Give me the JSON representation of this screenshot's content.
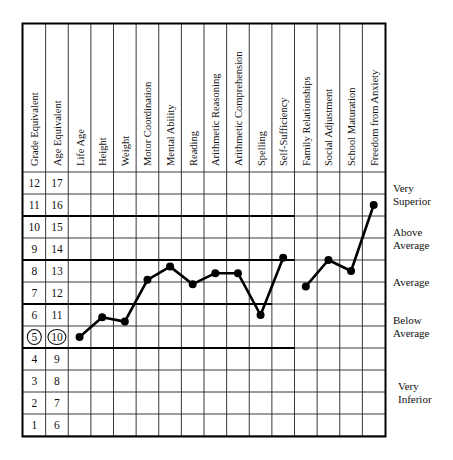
{
  "chart_data": {
    "type": "line",
    "title": "",
    "xlabel": "",
    "ylabel": "Grade Equivalent / Age Equivalent",
    "grid": true,
    "legend": "none",
    "categories": [
      "Grade Equivalent",
      "Age Equivalent",
      "Life Age",
      "Height",
      "Weight",
      "Motor Coordination",
      "Mental Ability",
      "Reading",
      "Arithmetic Reasoning",
      "Arithmetic Comprehension",
      "Spelling",
      "Self-Sufficiency",
      "Family Relationships",
      "Social Adjustment",
      "School Maturation",
      "Freedom from Anxiety"
    ],
    "plotted_categories": [
      "Life Age",
      "Height",
      "Weight",
      "Motor Coordination",
      "Mental Ability",
      "Reading",
      "Arithmetic Reasoning",
      "Arithmetic Comprehension",
      "Spelling",
      "Self-Sufficiency",
      "Family Relationships",
      "Social Adjustment",
      "School Maturation",
      "Freedom from Anxiety"
    ],
    "grade_values": [
      5.0,
      5.9,
      5.7,
      7.6,
      8.2,
      7.4,
      7.9,
      7.9,
      6.0,
      8.6,
      7.3,
      8.5,
      8.0,
      11.0
    ],
    "age_values": [
      10,
      10.9,
      10.7,
      12.6,
      13.2,
      12.4,
      12.9,
      12.9,
      11.0,
      13.6,
      12.3,
      13.5,
      13.0,
      16.0
    ],
    "series": [
      {
        "name": "Profile",
        "points": [
          {
            "category": "Life Age",
            "grade": 5.0,
            "age": 10
          },
          {
            "category": "Height",
            "grade": 5.9,
            "age": 10.9
          },
          {
            "category": "Weight",
            "grade": 5.7,
            "age": 10.7
          },
          {
            "category": "Motor Coordination",
            "grade": 7.6,
            "age": 12.6
          },
          {
            "category": "Mental Ability",
            "grade": 8.2,
            "age": 13.2
          },
          {
            "category": "Reading",
            "grade": 7.4,
            "age": 12.4
          },
          {
            "category": "Arithmetic Reasoning",
            "grade": 7.9,
            "age": 12.9
          },
          {
            "category": "Arithmetic Comprehension",
            "grade": 7.9,
            "age": 12.9
          },
          {
            "category": "Spelling",
            "grade": 6.0,
            "age": 11.0
          },
          {
            "category": "Self-Sufficiency",
            "grade": 8.6,
            "age": 13.6
          },
          {
            "category": "Family Relationships",
            "grade": 7.3,
            "age": 12.3
          },
          {
            "category": "Social Adjustment",
            "grade": 8.5,
            "age": 13.5
          },
          {
            "category": "School Maturation",
            "grade": 8.0,
            "age": 13.0
          },
          {
            "category": "Freedom from Anxiety",
            "grade": 11.0,
            "age": 16.0
          }
        ],
        "line_breaks_after": [
          "Self-Sufficiency"
        ]
      }
    ],
    "y_rows": [
      {
        "grade": "12",
        "age": "17",
        "circled": false
      },
      {
        "grade": "11",
        "age": "16",
        "circled": false
      },
      {
        "grade": "10",
        "age": "15",
        "circled": false
      },
      {
        "grade": "9",
        "age": "14",
        "circled": false
      },
      {
        "grade": "8",
        "age": "13",
        "circled": false
      },
      {
        "grade": "7",
        "age": "12",
        "circled": false
      },
      {
        "grade": "6",
        "age": "11",
        "circled": false
      },
      {
        "grade": "5",
        "age": "10",
        "circled": true
      },
      {
        "grade": "4",
        "age": "9",
        "circled": false
      },
      {
        "grade": "3",
        "age": "8",
        "circled": false
      },
      {
        "grade": "2",
        "age": "7",
        "circled": false
      },
      {
        "grade": "1",
        "age": "6",
        "circled": false
      }
    ],
    "bands": [
      {
        "label_line1": "Very",
        "label_line2": "Superior",
        "top_row": 0,
        "bottom_row": 1
      },
      {
        "label_line1": "Above",
        "label_line2": "Average",
        "top_row": 2,
        "bottom_row": 3
      },
      {
        "label_line1": "Average",
        "label_line2": "",
        "top_row": 4,
        "bottom_row": 5
      },
      {
        "label_line1": "Below",
        "label_line2": "Average",
        "top_row": 6,
        "bottom_row": 7
      },
      {
        "label_line1": "Very",
        "label_line2": "Inferior",
        "top_row": 8,
        "bottom_row": 11
      }
    ],
    "ylim_grade": [
      1,
      12
    ],
    "ylim_age": [
      6,
      17
    ]
  },
  "table": {
    "headers": [
      "Grade Equivalent",
      "Age Equivalent",
      "Life Age",
      "Height",
      "Weight",
      "Motor Coordination",
      "Mental Ability",
      "Reading",
      "Arithmetic Reasoning",
      "Arithmetic Comprehension",
      "Spelling",
      "Self-Sufficiency",
      "Family Relationships",
      "Social Adjustment",
      "School Maturation",
      "Freedom from Anxiety"
    ],
    "grade_column": [
      "12",
      "11",
      "10",
      "9",
      "8",
      "7",
      "5",
      "4",
      "3",
      "2",
      "1",
      "6"
    ],
    "rows": [
      {
        "grade": "12",
        "age": "17"
      },
      {
        "grade": "11",
        "age": "16"
      },
      {
        "grade": "10",
        "age": "15"
      },
      {
        "grade": "9",
        "age": "14"
      },
      {
        "grade": "8",
        "age": "13"
      },
      {
        "grade": "7",
        "age": "12"
      },
      {
        "grade": "6",
        "age": "11"
      },
      {
        "grade": "5",
        "age": "10"
      },
      {
        "grade": "4",
        "age": "9"
      },
      {
        "grade": "3",
        "age": "8"
      },
      {
        "grade": "2",
        "age": "7"
      },
      {
        "grade": "1",
        "age": "6"
      }
    ]
  },
  "band_labels": [
    {
      "line1": "Very",
      "line2": "Superior"
    },
    {
      "line1": "Above",
      "line2": "Average"
    },
    {
      "line1": "Average",
      "line2": ""
    },
    {
      "line1": "Below",
      "line2": "Average"
    },
    {
      "line1": "Very",
      "line2": "Inferior"
    }
  ],
  "colors": {
    "ink": "#000000",
    "background": "#ffffff",
    "grid": "#222222"
  }
}
